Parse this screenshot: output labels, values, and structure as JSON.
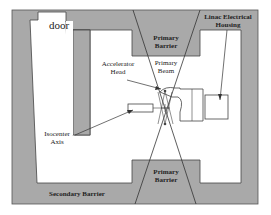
{
  "diagram": {
    "labels": {
      "door": "door",
      "primary_barrier_top_1": "Primary",
      "primary_barrier_top_2": "Barrier",
      "primary_beam_1": "Primary",
      "primary_beam_2": "Beam",
      "accelerator_head_1": "Accelerator",
      "accelerator_head_2": "Head",
      "linac_housing_1": "Linac Electrical",
      "linac_housing_2": "Housing",
      "isocenter_1": "Isocenter",
      "isocenter_2": "Axis",
      "primary_barrier_bottom_1": "Primary",
      "primary_barrier_bottom_2": "Barrier",
      "secondary_barrier": "Secondary Barrier"
    },
    "colors": {
      "concrete": "#a9a9a9",
      "room": "#ffffff",
      "line": "#333333"
    }
  }
}
